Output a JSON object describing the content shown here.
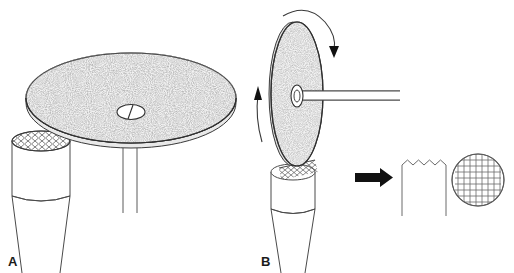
{
  "figure": {
    "type": "line-art-diagram",
    "background_color": "#ffffff",
    "width": 514,
    "height": 273,
    "stroke_color": "#3a3a3a",
    "texture_color": "#8a8a8a",
    "arrow_color": "#111111"
  },
  "panels": [
    {
      "id": "A",
      "label": "A",
      "label_x": 8,
      "label_y": 264,
      "description": "Horizontal abrasive disc viewed obliquely from above, resting on a cylindrical specimen; two thin support needles descend from the disc underside.",
      "parts": [
        {
          "name": "abrasive-disc-horizontal",
          "shape": "ellipse",
          "cx": 131,
          "cy": 98,
          "rx": 105,
          "ry": 45,
          "fill": "speckled-grey",
          "note": "stippled abrasive surface"
        },
        {
          "name": "disc-rim-edge",
          "shape": "ellipse-rim",
          "thickness": 5
        },
        {
          "name": "disc-center-hub",
          "shape": "small-ellipse",
          "cx": 131,
          "cy": 112,
          "rx": 13,
          "ry": 7,
          "fill": "#ffffff"
        },
        {
          "name": "hub-divider-line",
          "shape": "line"
        },
        {
          "name": "support-needle-left",
          "shape": "vertical-line",
          "x": 123,
          "y1": 143,
          "y2": 213
        },
        {
          "name": "support-needle-right",
          "shape": "vertical-line",
          "x": 137,
          "y1": 143,
          "y2": 213
        },
        {
          "name": "specimen-cylinder",
          "shape": "cylinder",
          "x": 12,
          "y": 135,
          "width": 58,
          "height": 90
        },
        {
          "name": "cylinder-cut-face-crosshatch",
          "shape": "ellipse-mesh",
          "cx": 41,
          "cy": 141,
          "rx": 29,
          "ry": 10,
          "pattern": "diamond-mesh"
        },
        {
          "name": "cylinder-tapered-neck",
          "shape": "taper",
          "top_width": 58,
          "bottom_width": 36
        }
      ]
    },
    {
      "id": "B",
      "label": "B",
      "label_x": 261,
      "label_y": 264,
      "description": "Vertical abrasive disc mounted on a horizontal shaft, rotating, grinding into the top of the cylindrical specimen.",
      "parts": [
        {
          "name": "abrasive-disc-vertical",
          "shape": "ellipse",
          "cx": 297,
          "cy": 94,
          "rx": 26,
          "ry": 72,
          "fill": "speckled-grey"
        },
        {
          "name": "disc-hub-vertical",
          "shape": "small-ellipse",
          "cx": 297,
          "cy": 96,
          "rx": 6,
          "ry": 11,
          "fill": "#ffffff"
        },
        {
          "name": "drive-shaft",
          "shape": "horizontal-rod",
          "x1": 297,
          "x2": 400,
          "y": 96,
          "thickness": 9
        },
        {
          "name": "rotation-arrow-top",
          "shape": "curved-arrow",
          "direction": "clockwise-over-top"
        },
        {
          "name": "feed-arrow-left",
          "shape": "straight-arrow",
          "direction": "up",
          "x": 258,
          "y1": 142,
          "y2": 88
        },
        {
          "name": "specimen-cylinder",
          "shape": "cylinder",
          "x": 271,
          "y": 166,
          "width": 44,
          "height": 72
        },
        {
          "name": "grinding-contact-crosshatch",
          "shape": "mesh-patch",
          "pattern": "diamond-mesh"
        },
        {
          "name": "cylinder-tapered-neck",
          "shape": "taper",
          "top_width": 44,
          "bottom_width": 26
        }
      ]
    }
  ],
  "result": {
    "transition_arrow": {
      "name": "result-arrow",
      "shape": "solid-block-arrow",
      "direction": "right",
      "x1": 355,
      "x2": 392,
      "y": 177,
      "color": "#111111"
    },
    "items": [
      {
        "name": "serrated-specimen-profile",
        "shape": "rectangle-with-zigzag-top",
        "x": 402,
        "y": 160,
        "width": 44,
        "height": 56,
        "teeth": 8,
        "tooth_depth": 5,
        "description": "Side profile of the ground specimen showing a serrated (saw-tooth) top surface"
      },
      {
        "name": "grid-sectioned-circle",
        "shape": "circle-with-grid",
        "cx": 478,
        "cy": 180,
        "r": 26,
        "grid_lines_horizontal": 8,
        "grid_lines_vertical": 8,
        "description": "Plan view of the specimen cross-section showing an orthogonal grid / cross-hatch pattern"
      }
    ]
  }
}
